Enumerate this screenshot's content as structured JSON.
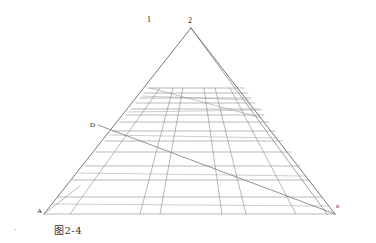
{
  "figure": {
    "caption": "图2-4",
    "labels": {
      "one": "1",
      "apex": "2",
      "d": "D",
      "a": "A",
      "b": "B",
      "margin_mark": "•"
    },
    "colors": {
      "line": "#555555",
      "grid": "#8a8a8a",
      "text": "#222222"
    },
    "geometry": {
      "apex": [
        191,
        28
      ],
      "base_left": [
        44,
        214
      ],
      "base_right": [
        335,
        214
      ],
      "grid_top_y": 88,
      "grid_top_left": [
        148,
        88
      ],
      "grid_top_right": [
        243,
        88
      ],
      "diagonal": {
        "from": [
          98,
          133
        ],
        "to": [
          335,
          214
        ]
      }
    }
  }
}
